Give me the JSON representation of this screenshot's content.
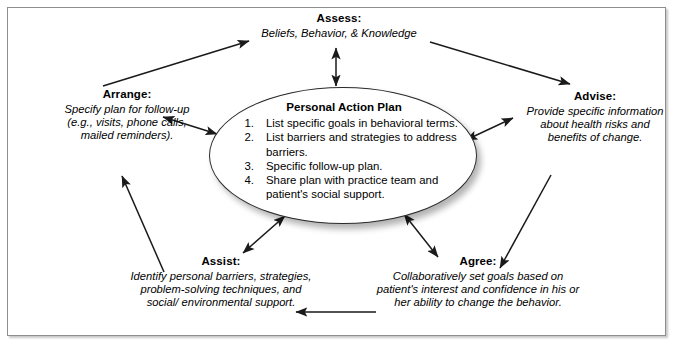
{
  "diagram": {
    "title_present": false,
    "center": {
      "title": "Personal Action Plan",
      "items": [
        {
          "num": "1.",
          "text": "List specific goals in behavioral terms."
        },
        {
          "num": "2.",
          "text": "List barriers and strategies to address barriers."
        },
        {
          "num": "3.",
          "text": "Specific follow-up plan."
        },
        {
          "num": "4.",
          "text": "Share plan with practice team and patient's social support."
        }
      ]
    },
    "nodes": [
      {
        "id": "assess",
        "heading": "Assess:",
        "body": "Beliefs, Behavior, & Knowledge"
      },
      {
        "id": "advise",
        "heading": "Advise:",
        "body": "Provide specific information about health risks and benefits of change."
      },
      {
        "id": "agree",
        "heading": "Agree:",
        "body": "Collaboratively set goals based on patient's interest and confidence in his or her ability to change the behavior."
      },
      {
        "id": "assist",
        "heading": "Assist:",
        "body": "Identify personal barriers, strategies, problem-solving techniques, and social/ environmental support."
      },
      {
        "id": "arrange",
        "heading": "Arrange:",
        "body": "Specify plan for follow-up (e.g., visits, phone calls, mailed reminders)."
      }
    ],
    "colors": {
      "line": "#1a1a1a",
      "frame": "#8e8e8e",
      "oval_border": "#2a2a2a",
      "background": "#ffffff"
    }
  }
}
